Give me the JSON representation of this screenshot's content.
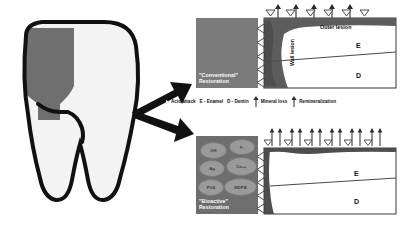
{
  "figure": {
    "tooth_illustration": {
      "name": "tooth-cross-section",
      "restoration_fill": "#6f6f6f",
      "enamel_fill": "#f2f2f2",
      "outline_color": "#111111"
    },
    "arrows": {
      "to_top_panel": "arrow-up-right",
      "to_bottom_panel": "arrow-down-right"
    }
  },
  "panels": [
    {
      "id": "conventional",
      "restoration_label_line1": "\"Conventional\"",
      "restoration_label_line2": "Restoration",
      "restoration_color": "#7b7b7b",
      "labels": {
        "outer_lesion": "Outer lesion",
        "wall_lesion": "Wall lesion",
        "enamel": "E",
        "dentin": "D"
      },
      "top_markers": {
        "mineral_loss_arrows": 5,
        "acid_attack_triangles": 5,
        "direction": "up"
      },
      "interface_markers": {
        "acid_attack_triangles": 5,
        "direction": "left"
      },
      "lesion": "large wall lesion and outer lesion"
    },
    {
      "id": "bioactive",
      "restoration_label_line1": "\"Bioactive\"",
      "restoration_label_line2": "Restoration",
      "restoration_color": "#6e6e6e",
      "ions": [
        {
          "label": "OH",
          "x": 4,
          "y": 6,
          "w": 25,
          "h": 15
        },
        {
          "label": "F-",
          "x": 33,
          "y": 3,
          "w": 24,
          "h": 14
        },
        {
          "label": "Ag",
          "x": 3,
          "y": 24,
          "w": 24,
          "h": 15
        },
        {
          "label": "Ca++",
          "x": 30,
          "y": 21,
          "w": 29,
          "h": 17
        },
        {
          "label": "PO4",
          "x": 2,
          "y": 43,
          "w": 24,
          "h": 15
        },
        {
          "label": "MDPB",
          "x": 28,
          "y": 42,
          "w": 31,
          "h": 16
        }
      ],
      "labels": {
        "enamel": "E",
        "dentin": "D"
      },
      "top_markers": {
        "remineralization_pairs": 6,
        "direction": "up-and-down"
      },
      "interface_markers": {
        "acid_attack_triangles": 5,
        "direction": "left"
      },
      "lesion": "minimal surface lesion"
    }
  ],
  "legend": {
    "items": [
      {
        "icon": "acid-attack-triangle",
        "label": "Acid attack"
      },
      {
        "icon": "none",
        "label": "E -  Enamel"
      },
      {
        "icon": "none",
        "label": "D - Dentin"
      },
      {
        "icon": "mineral-loss-arrow",
        "label": "Mineral loss"
      },
      {
        "icon": "remineralization-arrow",
        "label": "Remineralization"
      }
    ]
  }
}
